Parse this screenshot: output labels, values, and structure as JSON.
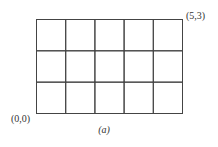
{
  "diagram": {
    "type": "grid",
    "columns": 5,
    "rows": 3,
    "corner_labels": {
      "bottom_left": "(0,0)",
      "top_right": "(5,3)"
    },
    "caption": "(a)",
    "line_color": "#444444"
  }
}
